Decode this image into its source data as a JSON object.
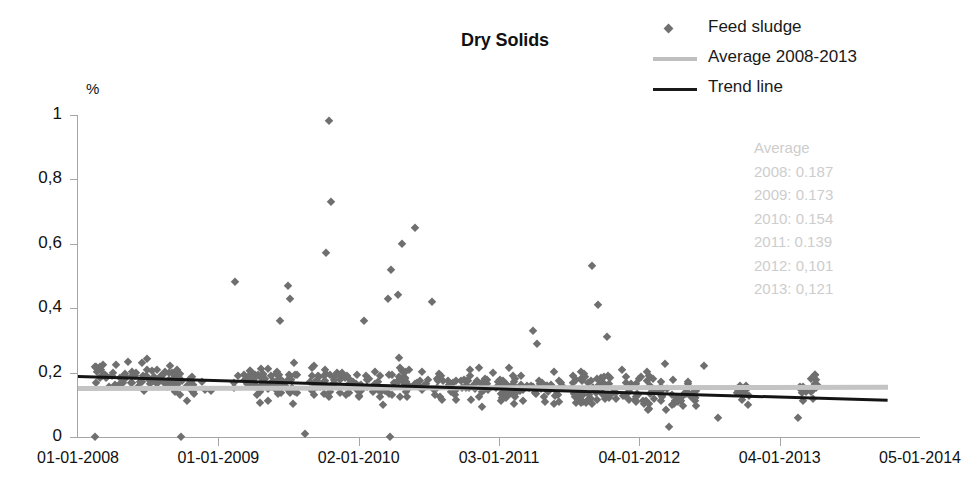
{
  "title": "Dry Solids",
  "unit_label": "%",
  "legend": {
    "position": "top-right",
    "items": [
      {
        "label": "Feed sludge",
        "key": "diamond-marker",
        "color": "#707070"
      },
      {
        "label": "Average 2008-2013",
        "key": "line",
        "color": "#bfbfbf"
      },
      {
        "label": "Trend line",
        "key": "line",
        "color": "#1a1a1a"
      }
    ]
  },
  "annotations": {
    "heading": "Average",
    "color": "#cdcdcd",
    "lines": [
      "Average",
      "2008: 0.187",
      "2009: 0.173",
      "2010: 0.154",
      "2011: 0.139",
      "2012: 0,101",
      "2013: 0,121"
    ]
  },
  "chart_data": {
    "type": "scatter",
    "title": "Dry Solids",
    "xlabel": "",
    "ylabel": "%",
    "ylim": [
      0,
      1
    ],
    "yticks": [
      0,
      0.2,
      0.4,
      0.6,
      0.8,
      1
    ],
    "ytick_labels": [
      "0",
      "0,2",
      "0,4",
      "0,6",
      "0,8",
      "1"
    ],
    "xtick_labels": [
      "01-01-2008",
      "01-01-2009",
      "02-01-2010",
      "03-01-2011",
      "04-01-2012",
      "04-01-2013",
      "05-01-2014"
    ],
    "xlim_fraction": [
      0,
      1
    ],
    "grid": false,
    "marker": {
      "shape": "diamond",
      "color": "#6f6f6f",
      "size_px": 9
    },
    "series": [
      {
        "name": "Feed sludge",
        "type": "scatter",
        "color": "#6f6f6f",
        "n_points_approx": 620,
        "note": "Dense daily/weekly sampling of dry solids percentage; most values 0.05-0.30 with sparse high outliers up to 0.98",
        "yearly_means": [
          0.187,
          0.173,
          0.154,
          0.139,
          0.101,
          0.121
        ],
        "clusters": [
          {
            "x0": 0.02,
            "x1": 0.075,
            "n": 34,
            "mean": 0.185,
            "spread": 0.055
          },
          {
            "x0": 0.075,
            "x1": 0.12,
            "n": 48,
            "mean": 0.175,
            "spread": 0.06
          },
          {
            "x0": 0.12,
            "x1": 0.16,
            "n": 18,
            "mean": 0.16,
            "spread": 0.045
          },
          {
            "x0": 0.185,
            "x1": 0.26,
            "n": 70,
            "mean": 0.175,
            "spread": 0.07
          },
          {
            "x0": 0.275,
            "x1": 0.33,
            "n": 44,
            "mean": 0.17,
            "spread": 0.065
          },
          {
            "x0": 0.33,
            "x1": 0.395,
            "n": 52,
            "mean": 0.165,
            "spread": 0.07
          },
          {
            "x0": 0.4,
            "x1": 0.45,
            "n": 30,
            "mean": 0.155,
            "spread": 0.06
          },
          {
            "x0": 0.455,
            "x1": 0.52,
            "n": 58,
            "mean": 0.16,
            "spread": 0.075
          },
          {
            "x0": 0.525,
            "x1": 0.575,
            "n": 36,
            "mean": 0.15,
            "spread": 0.06
          },
          {
            "x0": 0.585,
            "x1": 0.64,
            "n": 56,
            "mean": 0.15,
            "spread": 0.07
          },
          {
            "x0": 0.645,
            "x1": 0.7,
            "n": 44,
            "mean": 0.145,
            "spread": 0.08
          },
          {
            "x0": 0.705,
            "x1": 0.735,
            "n": 26,
            "mean": 0.13,
            "spread": 0.065
          },
          {
            "x0": 0.78,
            "x1": 0.8,
            "n": 14,
            "mean": 0.14,
            "spread": 0.05
          },
          {
            "x0": 0.855,
            "x1": 0.88,
            "n": 18,
            "mean": 0.145,
            "spread": 0.055
          }
        ],
        "outliers": [
          {
            "x": 0.298,
            "y": 0.98
          },
          {
            "x": 0.3,
            "y": 0.73
          },
          {
            "x": 0.295,
            "y": 0.57
          },
          {
            "x": 0.186,
            "y": 0.48
          },
          {
            "x": 0.4,
            "y": 0.65
          },
          {
            "x": 0.385,
            "y": 0.6
          },
          {
            "x": 0.372,
            "y": 0.52
          },
          {
            "x": 0.38,
            "y": 0.44
          },
          {
            "x": 0.368,
            "y": 0.43
          },
          {
            "x": 0.42,
            "y": 0.42
          },
          {
            "x": 0.249,
            "y": 0.47
          },
          {
            "x": 0.252,
            "y": 0.43
          },
          {
            "x": 0.24,
            "y": 0.36
          },
          {
            "x": 0.34,
            "y": 0.36
          },
          {
            "x": 0.61,
            "y": 0.53
          },
          {
            "x": 0.618,
            "y": 0.41
          },
          {
            "x": 0.628,
            "y": 0.31
          },
          {
            "x": 0.54,
            "y": 0.33
          },
          {
            "x": 0.545,
            "y": 0.29
          },
          {
            "x": 0.744,
            "y": 0.22
          },
          {
            "x": 0.02,
            "y": 0.0
          },
          {
            "x": 0.122,
            "y": 0.0
          },
          {
            "x": 0.27,
            "y": 0.01
          },
          {
            "x": 0.37,
            "y": 0.0
          },
          {
            "x": 0.702,
            "y": 0.03
          },
          {
            "x": 0.76,
            "y": 0.06
          },
          {
            "x": 0.855,
            "y": 0.06
          }
        ]
      },
      {
        "name": "Average 2008-2013",
        "type": "line",
        "color": "#c4c4c4",
        "x": [
          0.0,
          0.962
        ],
        "y": [
          0.158,
          0.162
        ]
      },
      {
        "name": "Trend line",
        "type": "line",
        "color": "#141414",
        "x": [
          0.0,
          0.962
        ],
        "y": [
          0.192,
          0.118
        ]
      }
    ]
  }
}
